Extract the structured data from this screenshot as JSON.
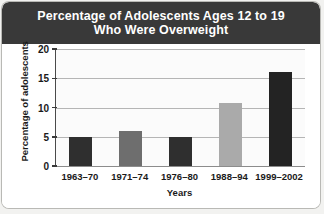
{
  "chart_data": {
    "type": "bar",
    "title": "Percentage of Adolescents Ages 12 to 19 Who Were Overweight",
    "title_line1": "Percentage of Adolescents Ages 12 to 19",
    "title_line2": "Who Were Overweight",
    "xlabel": "Years",
    "ylabel": "Percentage of adolescents",
    "categories": [
      "1963–70",
      "1971–74",
      "1976–80",
      "1988–94",
      "1999–2002"
    ],
    "values": [
      5,
      6,
      5,
      10.8,
      16
    ],
    "bar_colors": [
      "#2f2f2f",
      "#6e6e6e",
      "#2f2f2f",
      "#aaaaaa",
      "#232323"
    ],
    "ylim": [
      0,
      20
    ],
    "yticks": [
      0,
      5,
      10,
      15,
      20
    ],
    "ytick_labels": [
      "0",
      "5",
      "10",
      "15",
      "20"
    ],
    "grid": true,
    "legend": "none"
  },
  "theme": {
    "header_bg": "#393939",
    "header_text": "#ffffff",
    "card_bg": "#ffffff",
    "page_bg": "#f2f2f0",
    "grid_color": "#b5b5b5",
    "axis_color": "#4a4a4a"
  }
}
